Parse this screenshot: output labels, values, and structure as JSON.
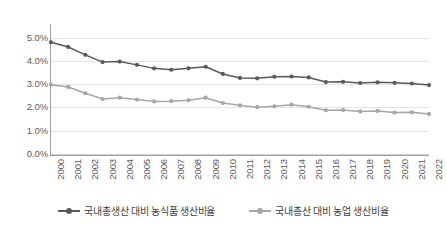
{
  "chart_data": {
    "type": "line",
    "title": "",
    "subtitle": "",
    "xlabel": "",
    "ylabel": "",
    "ylim": [
      0,
      5.5
    ],
    "ytick_values": [
      0.0,
      1.0,
      2.0,
      3.0,
      4.0,
      5.0
    ],
    "ytick_labels": [
      "0.0%",
      "1.0%",
      "2.0%",
      "3.0%",
      "4.0%",
      "5.0%"
    ],
    "grid": true,
    "grid_axis": "y",
    "legend_position": "bottom",
    "categories": [
      "2000",
      "2001",
      "2002",
      "2003",
      "2004",
      "2005",
      "2006",
      "2007",
      "2008",
      "2009",
      "2010",
      "2011",
      "2012",
      "2013",
      "2014",
      "2015",
      "2016",
      "2017",
      "2018",
      "2019",
      "2020",
      "2021",
      "2022"
    ],
    "series": [
      {
        "name": "국내총생산 대비 농식품 생산비율",
        "color": "#5a5a5a",
        "marker": "circle",
        "values": [
          4.8,
          4.6,
          4.26,
          3.95,
          3.97,
          3.83,
          3.68,
          3.62,
          3.68,
          3.75,
          3.44,
          3.27,
          3.25,
          3.32,
          3.33,
          3.29,
          3.09,
          3.1,
          3.05,
          3.08,
          3.06,
          3.03,
          2.96
        ]
      },
      {
        "name": "국내총산 대비 농업 생산비율",
        "color": "#a6a6a6",
        "marker": "circle",
        "values": [
          2.98,
          2.88,
          2.61,
          2.36,
          2.42,
          2.34,
          2.26,
          2.27,
          2.31,
          2.42,
          2.19,
          2.09,
          2.01,
          2.05,
          2.12,
          2.03,
          1.88,
          1.89,
          1.83,
          1.85,
          1.78,
          1.79,
          1.72
        ]
      }
    ]
  },
  "legend": {
    "items": [
      {
        "label": "국내총생산 대비 농식품 생산비율",
        "color": "#5a5a5a"
      },
      {
        "label": "국내총산 대비 농업 생산비율",
        "color": "#a6a6a6"
      }
    ]
  }
}
